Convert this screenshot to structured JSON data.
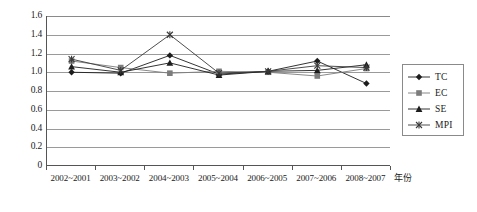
{
  "chart_data": {
    "type": "line",
    "title": "",
    "subtitle": "",
    "xlabel": "年份",
    "ylabel": "",
    "categories": [
      "2002~2001",
      "2003~2002",
      "2004~2003",
      "2005~2004",
      "2006~2005",
      "2007~2006",
      "2008~2007"
    ],
    "ylim": [
      0,
      1.6
    ],
    "ytick_labels": [
      "0",
      "0.2",
      "0.4",
      "0.6",
      "0.8",
      "1.0",
      "1.2",
      "1.4",
      "1.6"
    ],
    "ytick_values": [
      0,
      0.2,
      0.4,
      0.6,
      0.8,
      1.0,
      1.2,
      1.4,
      1.6
    ],
    "grid": true,
    "grid_axis": "y",
    "legend_position": "right",
    "series": [
      {
        "name": "TC",
        "marker": "diamond",
        "color": "#1d1d1d",
        "values": [
          1.0,
          0.99,
          1.18,
          0.98,
          1.01,
          1.12,
          0.88
        ]
      },
      {
        "name": "EC",
        "marker": "square",
        "color": "#7c7c7c",
        "values": [
          1.12,
          1.05,
          0.99,
          1.01,
          1.0,
          0.96,
          1.04
        ]
      },
      {
        "name": "SE",
        "marker": "triangle",
        "color": "#1d1d1d",
        "values": [
          1.06,
          1.0,
          1.1,
          0.97,
          1.01,
          1.02,
          1.08
        ]
      },
      {
        "name": "MPI",
        "marker": "cross",
        "color": "#3a3a3a",
        "values": [
          1.14,
          1.02,
          1.4,
          0.99,
          1.01,
          1.07,
          1.05
        ]
      }
    ]
  },
  "legend": {
    "items": [
      {
        "label": "TC"
      },
      {
        "label": "EC"
      },
      {
        "label": "SE"
      },
      {
        "label": "MPI"
      }
    ]
  },
  "axes": {
    "x_title": "年份"
  }
}
